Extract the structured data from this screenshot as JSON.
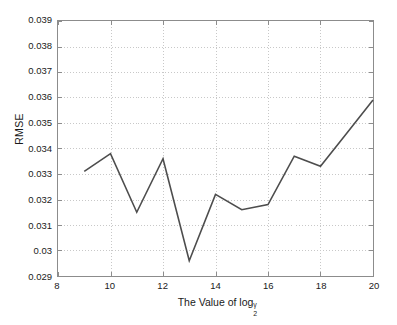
{
  "chart_data": {
    "type": "line",
    "title": "",
    "xlabel": "The Value of log",
    "xlabel_sub": "2",
    "xlabel_sup": "γ",
    "ylabel": "RMSE",
    "xlim": [
      8,
      20
    ],
    "ylim": [
      0.029,
      0.039
    ],
    "xticks": [
      8,
      10,
      12,
      14,
      16,
      18,
      20
    ],
    "xtick_labels": [
      "8",
      "10",
      "12",
      "14",
      "16",
      "18",
      "20"
    ],
    "yticks": [
      0.029,
      0.03,
      0.031,
      0.032,
      0.033,
      0.034,
      0.035,
      0.036,
      0.037,
      0.038,
      0.039
    ],
    "ytick_labels": [
      "0.029",
      "0.03",
      "0.031",
      "0.032",
      "0.033",
      "0.034",
      "0.035",
      "0.036",
      "0.037",
      "0.038",
      "0.039"
    ],
    "grid": true,
    "grid_style": "dotted",
    "legend": null,
    "series": [
      {
        "name": "RMSE",
        "color": "#4d4d4d",
        "x": [
          9,
          10,
          11,
          12,
          13,
          14,
          15,
          16,
          17,
          18,
          19,
          20
        ],
        "values": [
          0.0331,
          0.0338,
          0.0315,
          0.0336,
          0.0296,
          0.0322,
          0.0316,
          0.0318,
          0.0337,
          0.0333,
          0.0346,
          0.0359
        ]
      }
    ]
  },
  "style": {
    "axis_color": "#8c8c8c",
    "grid_color": "#c8c8c8",
    "text_color": "#1a1a1a",
    "background": "#ffffff"
  }
}
